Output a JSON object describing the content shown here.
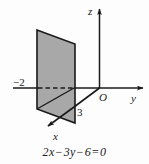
{
  "figure": {
    "type": "3d-coordinate-plane-sketch",
    "caption": {
      "full": "2x − 3y − 6 = 0",
      "parts": {
        "coef_x": "2",
        "var_x": "x",
        "minus_1": "−",
        "coef_y": "3",
        "var_y": "y",
        "minus_2": "−",
        "constant": "6",
        "equals": "=",
        "rhs": "0"
      }
    },
    "axes": [
      {
        "name": "x-axis",
        "label": "x",
        "direction": "down-left",
        "has_arrow": true
      },
      {
        "name": "y-axis",
        "label": "y",
        "direction": "right",
        "has_arrow": true
      },
      {
        "name": "z-axis",
        "label": "z",
        "direction": "up",
        "has_arrow": true
      }
    ],
    "origin_label": "O",
    "intercepts": [
      {
        "axis": "y",
        "label": "−2",
        "value": -2
      },
      {
        "axis": "x",
        "label": "3",
        "value": 3
      }
    ],
    "plane": {
      "description": "shaded parallelogram representing plane 2x - 3y - 6 = 0",
      "fill_color": "#a8a8a8",
      "edge_color": "#1a1a1a"
    },
    "hidden_segment": {
      "description": "dashed portion of y-axis behind the shaded plane",
      "style": "dashed"
    },
    "colors": {
      "background": "#fdfdfd",
      "ink": "#1a1a1a",
      "plane_fill": "#a8a8a8"
    }
  }
}
